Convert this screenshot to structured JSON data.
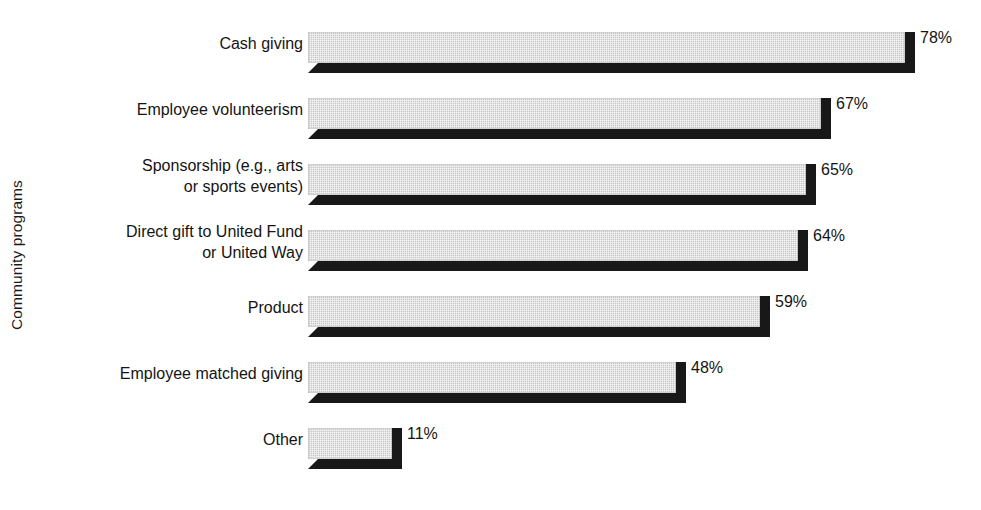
{
  "chart_data": {
    "type": "bar",
    "orientation": "horizontal",
    "title": "",
    "subtitle": "",
    "xlabel": "",
    "ylabel": "Community programs",
    "grid": false,
    "legend": null,
    "value_suffix": "%",
    "xlim": [
      0,
      100
    ],
    "categories": [
      "Cash giving",
      "Employee volunteerism",
      "Sponsorship (e.g., arts\nor sports events)",
      "Direct gift to United Fund\nor United Way",
      "Product",
      "Employee matched giving",
      "Other"
    ],
    "values": [
      78,
      67,
      65,
      64,
      59,
      48,
      11
    ],
    "value_labels": [
      "78%",
      "67%",
      "65%",
      "64%",
      "59%",
      "48%",
      "11%"
    ],
    "colors": {
      "bar_face": "#d2d2d2",
      "bar_shadow": "#181818",
      "background": "#ffffff",
      "text": "#141414"
    }
  }
}
